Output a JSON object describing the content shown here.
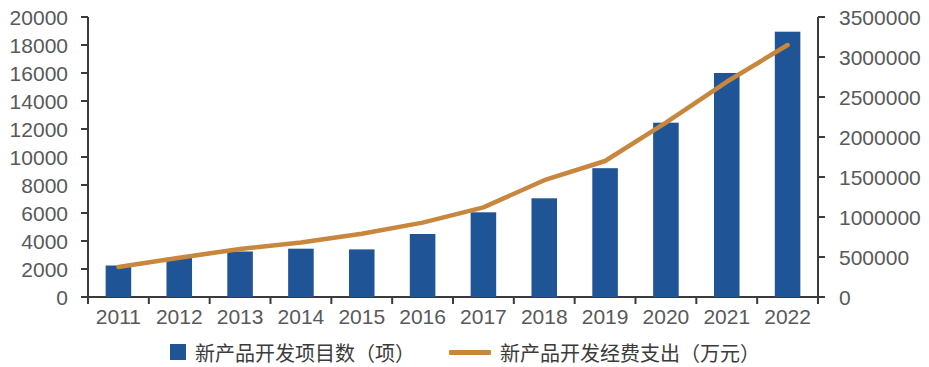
{
  "chart_data": {
    "type": "bar",
    "title": "",
    "subtitle": "",
    "xlabel": "",
    "ylabel": "",
    "categories": [
      "2011",
      "2012",
      "2013",
      "2014",
      "2015",
      "2016",
      "2017",
      "2018",
      "2019",
      "2020",
      "2021",
      "2022"
    ],
    "grid": false,
    "legend_position": "bottom",
    "axes": {
      "x": {
        "tick_labels": [
          "2011",
          "2012",
          "2013",
          "2014",
          "2015",
          "2016",
          "2017",
          "2018",
          "2019",
          "2020",
          "2021",
          "2022"
        ]
      },
      "y_left": {
        "min": 0,
        "max": 20000,
        "step": 2000,
        "tick_labels": [
          "0",
          "2000",
          "4000",
          "6000",
          "8000",
          "10000",
          "12000",
          "14000",
          "16000",
          "18000",
          "20000"
        ]
      },
      "y_right": {
        "min": 0,
        "max": 3500000,
        "step": 500000,
        "tick_labels": [
          "0",
          "500000",
          "1000000",
          "1500000",
          "2000000",
          "2500000",
          "3000000",
          "3500000"
        ]
      }
    },
    "series": [
      {
        "name": "新产品开发项目数（项）",
        "type": "bar",
        "axis": "left",
        "color": "#1f5496",
        "values": [
          2250,
          2800,
          3250,
          3450,
          3400,
          4500,
          6050,
          7050,
          9200,
          12450,
          16000,
          18950
        ]
      },
      {
        "name": "新产品开发经费支出（万元）",
        "type": "line",
        "axis": "right",
        "color": "#c8873c",
        "values": [
          375000,
          490000,
          600000,
          680000,
          790000,
          930000,
          1120000,
          1460000,
          1700000,
          2180000,
          2690000,
          3150000
        ]
      }
    ]
  },
  "legend": {
    "items": [
      {
        "label": "新产品开发项目数（项）",
        "marker": "square-swatch-icon",
        "color": "#1f5496"
      },
      {
        "label": "新产品开发经费支出（万元）",
        "marker": "line-swatch-icon",
        "color": "#c8873c"
      }
    ]
  },
  "colors": {
    "bar": "#1f5496",
    "line": "#c8873c",
    "axis": "#3b3b3b",
    "tick_text": "#58595b",
    "background": "#ffffff"
  }
}
